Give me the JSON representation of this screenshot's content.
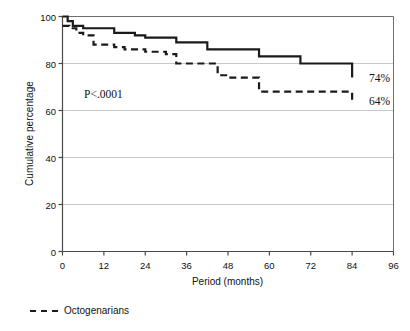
{
  "chart_data": {
    "type": "line",
    "title": "",
    "subtitle": "",
    "xlabel": "Period (months)",
    "ylabel": "Cumulative percentage",
    "xlim": [
      0,
      96
    ],
    "ylim": [
      0,
      100
    ],
    "xticks": [
      0,
      12,
      24,
      36,
      48,
      60,
      72,
      84,
      96
    ],
    "yticks": [
      0,
      20,
      40,
      60,
      80,
      100
    ],
    "grid": "horizontal",
    "legend_position": "below-axes-left",
    "step_style": "post",
    "annotations": [
      {
        "name": "p-value",
        "text": "P<.0001",
        "x": 10,
        "y": 69
      },
      {
        "name": "endpoint-solid",
        "text": "74%",
        "x": 86,
        "y": 74
      },
      {
        "name": "endpoint-dashed",
        "text": "64%",
        "x": 86,
        "y": 64
      }
    ],
    "series": [
      {
        "name": "Nonoctogenarians",
        "style": "solid",
        "color": "#1a1a1a",
        "end_label": "74%",
        "x": [
          0,
          1.5,
          3,
          6,
          9,
          15,
          18,
          21,
          24,
          33,
          36,
          42,
          48,
          57,
          60,
          69,
          72,
          84
        ],
        "y": [
          100,
          98,
          96,
          95,
          95,
          93,
          93,
          92,
          91,
          89,
          89,
          86,
          86,
          83,
          83,
          80,
          80,
          74
        ]
      },
      {
        "name": "Octogenarians",
        "style": "dashed",
        "color": "#1a1a1a",
        "end_label": "64%",
        "x": [
          0,
          2,
          4,
          6,
          9,
          15,
          18,
          21,
          24,
          30,
          33,
          36,
          42,
          45,
          48,
          54,
          57,
          60,
          84
        ],
        "y": [
          96,
          95,
          93,
          92,
          88,
          87,
          86,
          86,
          85,
          84,
          80,
          80,
          80,
          75,
          74,
          74,
          68,
          68,
          64
        ]
      }
    ]
  },
  "legend": {
    "items": [
      {
        "label": "Octogenarians",
        "style": "dashed"
      }
    ]
  }
}
